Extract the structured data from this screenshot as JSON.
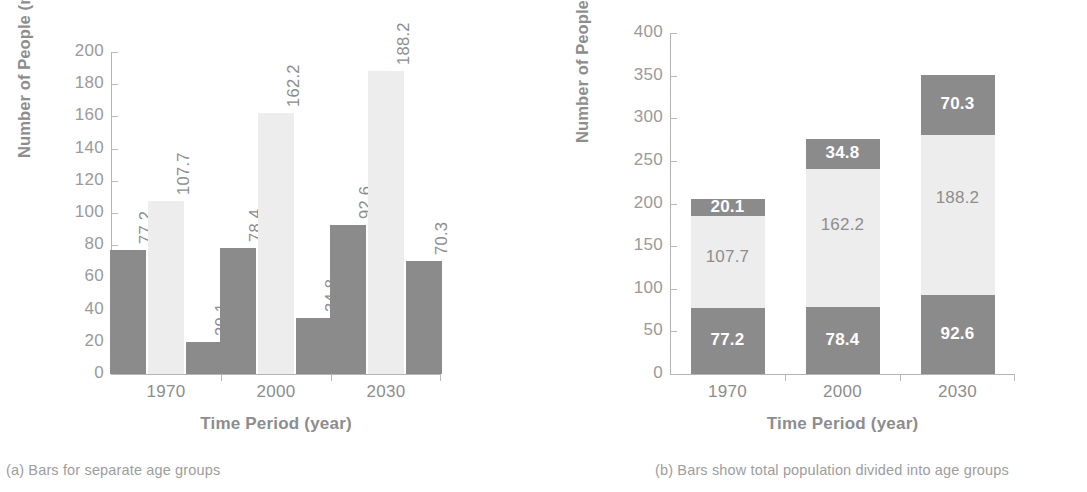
{
  "figure_a": {
    "caption": "(a) Bars for separate age groups",
    "axis": {
      "ylabel": "Number of People (millions)",
      "xlabel": "Time Period (year)",
      "yticks": [
        "0",
        "20",
        "40",
        "60",
        "80",
        "100",
        "120",
        "140",
        "160",
        "180",
        "200"
      ],
      "xticks": [
        "1970",
        "2000",
        "2030"
      ]
    }
  },
  "figure_b": {
    "caption": "(b) Bars show total population divided into age groups",
    "axis": {
      "ylabel": "Number of People (millions)",
      "xlabel": "Time Period (year)",
      "yticks": [
        "0",
        "50",
        "100",
        "150",
        "200",
        "250",
        "300",
        "350",
        "400"
      ],
      "xticks": [
        "1970",
        "2000",
        "2030"
      ]
    }
  },
  "colors": {
    "dark_gray": "#8b8b8b",
    "light_gray": "#ededed",
    "text_gray": "#8d8d8d",
    "axis_gray": "#b4b4b4",
    "background": "#ffffff"
  },
  "chart_data": [
    {
      "type": "bar",
      "id": "a",
      "title": "",
      "subtitle": "(a) Bars for separate age groups",
      "grouping": "grouped",
      "categories": [
        "1970",
        "2000",
        "2030"
      ],
      "series": [
        {
          "name": "series-1",
          "color": "#8b8b8b",
          "values": [
            77.2,
            78.4,
            92.6
          ],
          "labels": [
            "77.2",
            "78.4",
            "92.6"
          ]
        },
        {
          "name": "series-2",
          "color": "#ededed",
          "values": [
            107.7,
            162.2,
            188.2
          ],
          "labels": [
            "107.7",
            "162.2",
            "188.2"
          ]
        },
        {
          "name": "series-3",
          "color": "#8b8b8b",
          "values": [
            20.1,
            34.8,
            70.3
          ],
          "labels": [
            "20.1",
            "34.8",
            "70.3"
          ]
        }
      ],
      "xlabel": "Time Period (year)",
      "ylabel": "Number of People (millions)",
      "ylim": [
        0,
        200
      ],
      "ytick_step": 20,
      "grid": false,
      "legend": "none",
      "data_label_rotation": 90
    },
    {
      "type": "bar",
      "id": "b",
      "title": "",
      "subtitle": "(b) Bars show total population divided into age groups",
      "grouping": "stacked",
      "categories": [
        "1970",
        "2000",
        "2030"
      ],
      "series": [
        {
          "name": "series-1",
          "color": "#8b8b8b",
          "values": [
            77.2,
            78.4,
            92.6
          ],
          "labels": [
            "77.2",
            "78.4",
            "92.6"
          ]
        },
        {
          "name": "series-2",
          "color": "#ededed",
          "values": [
            107.7,
            162.2,
            188.2
          ],
          "labels": [
            "107.7",
            "162.2",
            "188.2"
          ]
        },
        {
          "name": "series-3",
          "color": "#8b8b8b",
          "values": [
            20.1,
            34.8,
            70.3
          ],
          "labels": [
            "20.1",
            "34.8",
            "70.3"
          ]
        }
      ],
      "totals": [
        205.0,
        275.4,
        351.1
      ],
      "xlabel": "Time Period (year)",
      "ylabel": "Number of People (millions)",
      "ylim": [
        0,
        400
      ],
      "ytick_step": 50,
      "grid": false,
      "legend": "none",
      "data_label_rotation": 0
    }
  ]
}
